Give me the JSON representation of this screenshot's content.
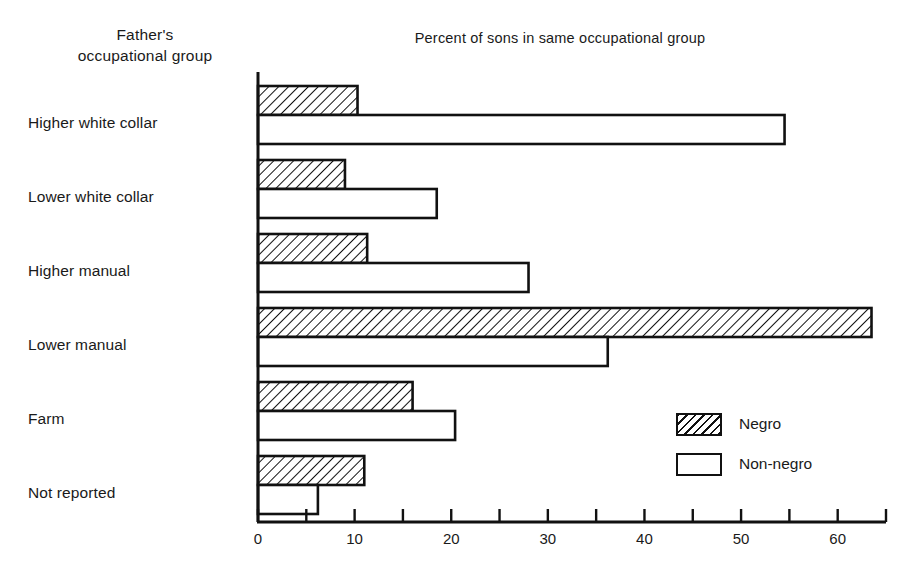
{
  "headers": {
    "category_axis_title_line1": "Father's",
    "category_axis_title_line2": "occupational group",
    "chart_title": "Percent of sons in same occupational group"
  },
  "legend": {
    "items": [
      {
        "label": "Negro",
        "swatch": "hatched-swatch"
      },
      {
        "label": "Non-negro",
        "swatch": "open-swatch"
      }
    ]
  },
  "axis": {
    "ticks": [
      "0",
      "10",
      "20",
      "30",
      "40",
      "50",
      "60"
    ],
    "tick_values": [
      0,
      10,
      20,
      30,
      40,
      50,
      60
    ],
    "minor_step": 5,
    "min": 0,
    "max": 65
  },
  "categories": [
    "Higher white collar",
    "Lower white collar",
    "Higher manual",
    "Lower manual",
    "Farm",
    "Not reported"
  ],
  "colors": {
    "ink": "#111111",
    "paper": "#ffffff"
  },
  "chart_data": {
    "type": "bar",
    "orientation": "horizontal",
    "title": "Percent of sons in same occupational group",
    "xlabel": "Percent of sons in same occupational group",
    "ylabel": "Father's occupational group",
    "xlim": [
      0,
      65
    ],
    "grid": false,
    "legend_position": "inside-right-lower",
    "categories": [
      "Higher white collar",
      "Lower white collar",
      "Higher manual",
      "Lower manual",
      "Farm",
      "Not reported"
    ],
    "series": [
      {
        "name": "Negro",
        "values": [
          10.3,
          9.0,
          11.3,
          63.5,
          16.0,
          11.0
        ]
      },
      {
        "name": "Non-negro",
        "values": [
          54.5,
          18.5,
          28.0,
          36.2,
          20.4,
          6.2
        ]
      }
    ]
  }
}
